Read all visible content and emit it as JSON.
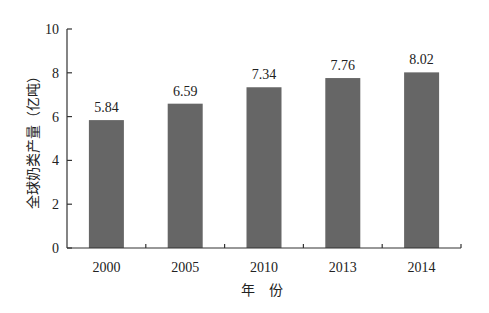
{
  "chart_data": {
    "type": "bar",
    "title": "",
    "xlabel": "年　份",
    "ylabel": "全球奶类产量（亿吨）",
    "categories": [
      "2000",
      "2005",
      "2010",
      "2013",
      "2014"
    ],
    "values": [
      5.84,
      6.59,
      7.34,
      7.76,
      8.02
    ],
    "value_labels": [
      "5.84",
      "6.59",
      "7.34",
      "7.76",
      "8.02"
    ],
    "ylim": [
      0,
      10
    ],
    "yticks": [
      0,
      2,
      4,
      6,
      8,
      10
    ],
    "grid": false,
    "legend": null,
    "bar_color": "#666666"
  }
}
